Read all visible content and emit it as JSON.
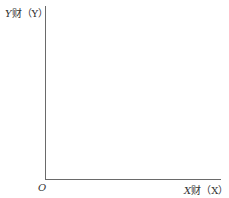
{
  "diagram": {
    "type": "blank-axes",
    "y_axis": {
      "var": "Y",
      "name": "财",
      "paren": "（Y）"
    },
    "x_axis": {
      "var": "X",
      "name": "财",
      "paren": "（X）"
    },
    "origin_label": "O"
  }
}
